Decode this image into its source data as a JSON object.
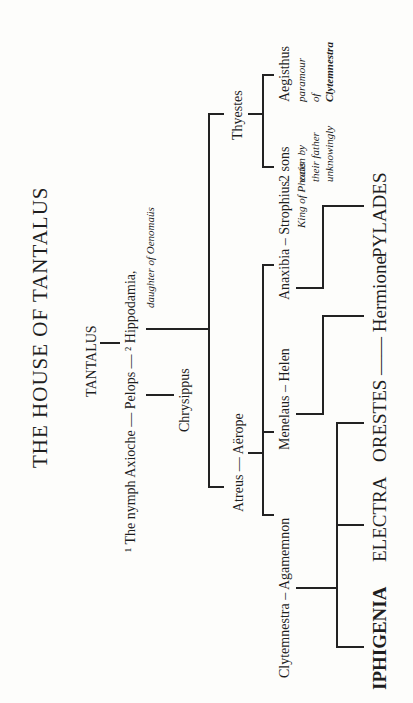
{
  "title": "THE HOUSE OF TANTALUS",
  "nodes": {
    "tantalus": "TANTALUS",
    "axioche": "¹ The nymph Axioche — Pelops — ² Hippodamia,",
    "hippodamia_note": "daughter of Oenomaüs",
    "chrysippus": "Chrysippus",
    "thyestes": "Thyestes",
    "atreus_aerope": "Atreus — Aërope",
    "two_sons": "2 sons",
    "two_sons_note": [
      "eaten by",
      "their father",
      "unknowingly"
    ],
    "aegisthus": "Aegisthus",
    "aegisthus_note": [
      "paramour",
      "of",
      "Clytemnestra"
    ],
    "clytemnestra_agamemnon": "Clytemnestra – Agamemnon",
    "menelaus_helen": "Menelaus – Helen",
    "anaxibia_strophius": "Anaxibia – Strophius",
    "strophius_note": "King of Phocis",
    "iphigenia": "IPHIGENIA",
    "electra": "ELECTRA",
    "orestes_hermione": "ORESTES —— Hermione",
    "pylades": "PYLADES"
  },
  "colors": {
    "ink": "#222222",
    "paper": "#fdfdfb"
  }
}
